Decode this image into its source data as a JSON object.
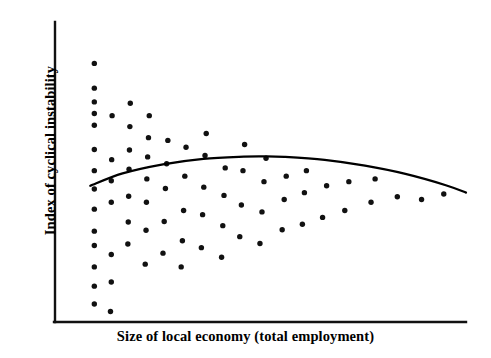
{
  "chart_data": {
    "type": "scatter",
    "title": "",
    "xlabel": "Size of local economy (total employment)",
    "ylabel": "Index of cyclical instability",
    "grid": false,
    "legend": null,
    "axes": {
      "x_axis_visible": true,
      "y_axis_visible": true,
      "x_ticks": [],
      "y_ticks": [],
      "xlim": [
        0,
        100
      ],
      "ylim": [
        0,
        100
      ],
      "note": "Axes are unlabeled/schematic; no numeric tick marks are printed."
    },
    "marker": {
      "shape": "circle",
      "color": "#111111",
      "size_px": 5.4
    },
    "series": [
      {
        "name": "observations",
        "points": [
          [
            8.0,
            91.5
          ],
          [
            8.0,
            82.5
          ],
          [
            8.0,
            77.5
          ],
          [
            8.0,
            73.3
          ],
          [
            8.0,
            69.0
          ],
          [
            8.0,
            60.2
          ],
          [
            8.0,
            52.5
          ],
          [
            8.0,
            45.8
          ],
          [
            8.0,
            38.5
          ],
          [
            8.0,
            30.5
          ],
          [
            8.0,
            25.3
          ],
          [
            8.0,
            17.5
          ],
          [
            8.0,
            10.5
          ],
          [
            8.0,
            4.0
          ],
          [
            12.0,
            1.3
          ],
          [
            12.2,
            12.0
          ],
          [
            12.2,
            22.0
          ],
          [
            12.2,
            41.0
          ],
          [
            12.2,
            48.8
          ],
          [
            12.3,
            56.5
          ],
          [
            12.4,
            72.5
          ],
          [
            16.3,
            25.8
          ],
          [
            16.4,
            33.8
          ],
          [
            16.5,
            43.2
          ],
          [
            16.6,
            53.0
          ],
          [
            16.7,
            60.0
          ],
          [
            16.8,
            68.5
          ],
          [
            16.9,
            77.0
          ],
          [
            20.6,
            18.5
          ],
          [
            20.8,
            30.8
          ],
          [
            20.9,
            41.0
          ],
          [
            21.0,
            49.5
          ],
          [
            21.2,
            57.5
          ],
          [
            21.4,
            64.5
          ],
          [
            21.6,
            72.5
          ],
          [
            25.0,
            22.5
          ],
          [
            25.3,
            34.0
          ],
          [
            25.6,
            46.0
          ],
          [
            25.9,
            55.0
          ],
          [
            26.2,
            63.5
          ],
          [
            29.5,
            17.5
          ],
          [
            29.8,
            27.0
          ],
          [
            30.1,
            38.0
          ],
          [
            30.4,
            50.5
          ],
          [
            30.7,
            61.0
          ],
          [
            34.5,
            24.5
          ],
          [
            34.8,
            36.5
          ],
          [
            35.1,
            46.5
          ],
          [
            35.4,
            58.0
          ],
          [
            35.7,
            66.0
          ],
          [
            39.5,
            21.0
          ],
          [
            39.8,
            32.5
          ],
          [
            40.1,
            43.5
          ],
          [
            40.4,
            53.5
          ],
          [
            44.0,
            28.5
          ],
          [
            44.4,
            40.0
          ],
          [
            44.8,
            52.5
          ],
          [
            45.2,
            62.0
          ],
          [
            49.0,
            26.0
          ],
          [
            49.5,
            37.5
          ],
          [
            50.0,
            48.5
          ],
          [
            50.5,
            57.0
          ],
          [
            54.5,
            31.0
          ],
          [
            55.0,
            42.0
          ],
          [
            55.5,
            50.5
          ],
          [
            59.5,
            33.0
          ],
          [
            60.0,
            44.5
          ],
          [
            60.5,
            52.5
          ],
          [
            64.5,
            35.5
          ],
          [
            65.5,
            47.0
          ],
          [
            70.0,
            38.0
          ],
          [
            71.0,
            48.5
          ],
          [
            76.5,
            41.0
          ],
          [
            77.5,
            49.5
          ],
          [
            83.0,
            43.0
          ],
          [
            89.0,
            42.0
          ],
          [
            94.5,
            44.0
          ]
        ]
      }
    ],
    "fit_curve": {
      "name": "quadratic fit",
      "color": "#000000",
      "width_px": 2.2,
      "description": "Concave-down quadratic: rises from the left, peaks near the middle-left, then declines gently to the right.",
      "points": [
        [
          7.0,
          47.0
        ],
        [
          15.0,
          51.5
        ],
        [
          25.0,
          54.8
        ],
        [
          35.0,
          56.8
        ],
        [
          45.0,
          57.6
        ],
        [
          50.0,
          57.7
        ],
        [
          55.0,
          57.5
        ],
        [
          65.0,
          56.4
        ],
        [
          75.0,
          54.3
        ],
        [
          85.0,
          51.3
        ],
        [
          95.0,
          47.2
        ],
        [
          100.0,
          44.5
        ]
      ]
    }
  }
}
